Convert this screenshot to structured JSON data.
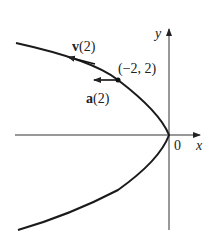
{
  "diagram": {
    "title": "",
    "axes": {
      "x_label": "x",
      "y_label": "y",
      "origin_label": "0"
    },
    "curve": {
      "description": "parabola opening left, x = -y^2/2, vertex at origin"
    },
    "point": {
      "label": "(−2, 2)",
      "x": -2,
      "y": 2
    },
    "vectors": [
      {
        "name": "v",
        "arg": "(2)",
        "label": "v(2)"
      },
      {
        "name": "a",
        "arg": "(2)",
        "label": "a(2)"
      }
    ]
  },
  "colors": {
    "curve": "#1a1a1a",
    "axes": "#333333",
    "background": "#ffffff"
  }
}
